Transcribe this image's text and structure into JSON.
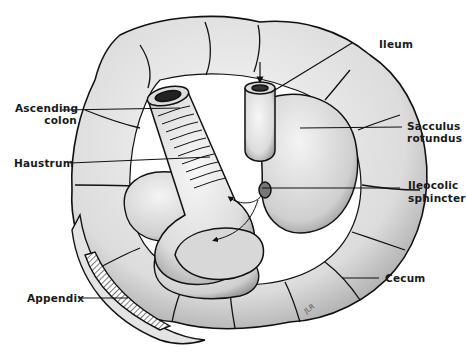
{
  "figure": {
    "signature": "JLR"
  },
  "labels": {
    "ileum": "Ileum",
    "ascending_colon_1": "Ascending",
    "ascending_colon_2": "colon",
    "sacculus_1": "Sacculus",
    "sacculus_2": "rotundus",
    "haustrum": "Haustrum",
    "ileocolic_1": "Ileocolic",
    "ileocolic_2": "sphincter",
    "cecum": "Cecum",
    "appendix": "Appendix"
  },
  "colors": {
    "ink": "#111111",
    "fill": "#e9e9e9",
    "shade": "#bdbdbd",
    "background": "#ffffff"
  }
}
